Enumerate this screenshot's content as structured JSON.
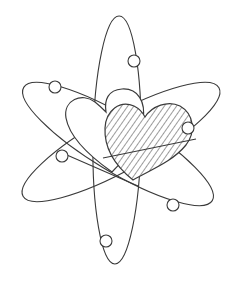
{
  "image": {
    "subject": "atom with two hearts as nucleus",
    "background_color": "#ffffff",
    "line_color": "#3a3a3a",
    "orbits": [
      {
        "name": "vertical-orbit",
        "cx": 117,
        "cy": 140,
        "rx": 24,
        "ry": 124,
        "rotate": 1
      },
      {
        "name": "rising-orbit",
        "cx": 121,
        "cy": 142,
        "rx": 112,
        "ry": 28,
        "rotate": -29
      },
      {
        "name": "falling-orbit",
        "cx": 118,
        "cy": 144,
        "rx": 110,
        "ry": 28,
        "rotate": 31
      }
    ],
    "electrons": [
      {
        "name": "electron-top",
        "cx": 134,
        "cy": 61,
        "r": 6
      },
      {
        "name": "electron-upper-left",
        "cx": 55,
        "cy": 87,
        "r": 6
      },
      {
        "name": "electron-right",
        "cx": 188,
        "cy": 128,
        "r": 6
      },
      {
        "name": "electron-left",
        "cx": 62,
        "cy": 156,
        "r": 6
      },
      {
        "name": "electron-lower-right",
        "cx": 173,
        "cy": 205,
        "r": 6
      },
      {
        "name": "electron-bottom",
        "cx": 106,
        "cy": 241,
        "r": 6
      }
    ],
    "hearts": [
      {
        "name": "outline-heart",
        "style": "outline"
      },
      {
        "name": "hatched-heart",
        "style": "diagonal-hatch"
      }
    ]
  }
}
